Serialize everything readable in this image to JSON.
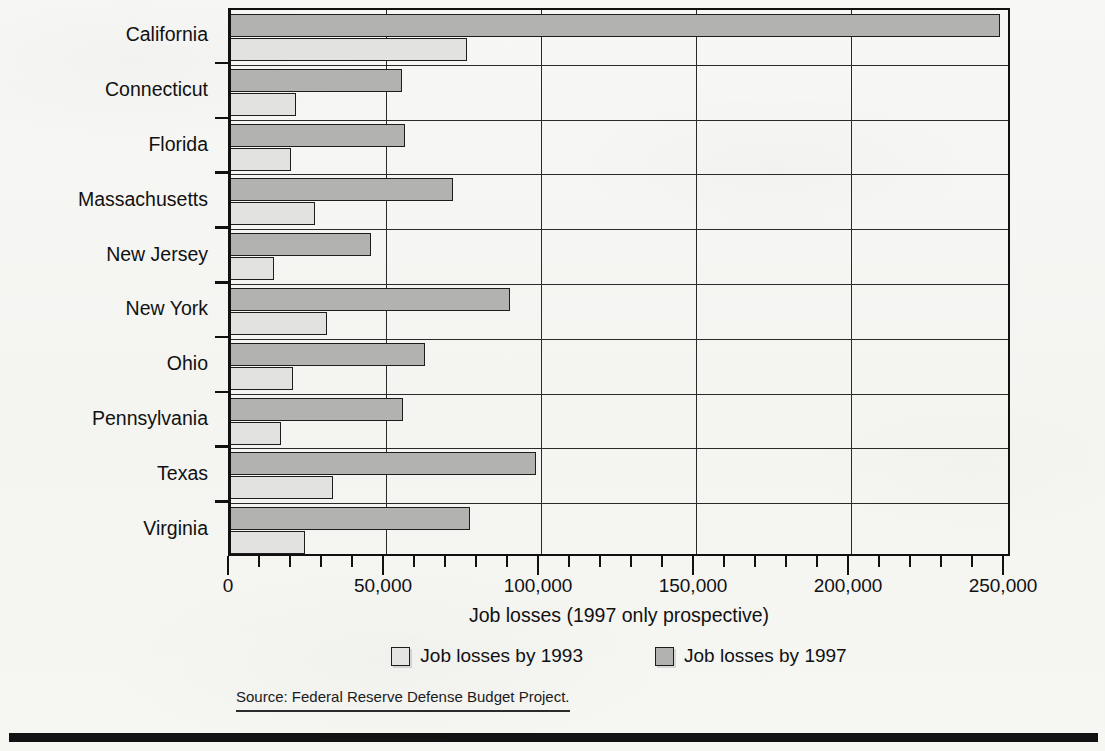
{
  "chart_data": {
    "type": "bar",
    "orientation": "horizontal",
    "title": "",
    "xlabel": "Job losses (1997 only prospective)",
    "ylabel": "",
    "xlim": [
      0,
      250000
    ],
    "xticks": [
      0,
      50000,
      100000,
      150000,
      200000,
      250000
    ],
    "xticklabels": [
      "0",
      "50,000",
      "100,000",
      "150,000",
      "200,000",
      "250,000"
    ],
    "minor_tick_step": 10000,
    "grid": "vertical major gridlines only",
    "legend_position": "below axis, centered",
    "categories": [
      "California",
      "Connecticut",
      "Florida",
      "Massachusetts",
      "New Jersey",
      "New York",
      "Ohio",
      "Pennsylvania",
      "Texas",
      "Virginia"
    ],
    "series": [
      {
        "name": "Job losses by 1993",
        "color": "#e2e2e0",
        "values": [
          76000,
          21000,
          19500,
          27000,
          14000,
          31000,
          20000,
          16000,
          33000,
          24000
        ]
      },
      {
        "name": "Job losses by 1997",
        "color": "#b2b2b0",
        "values": [
          248000,
          55000,
          56000,
          71500,
          45000,
          90000,
          62500,
          55500,
          98500,
          77000
        ]
      }
    ]
  },
  "axis": {
    "x_title": "Job losses (1997 only prospective)"
  },
  "legend": {
    "entries": [
      {
        "label": "Job losses by 1993",
        "swatch": "light-gray-swatch"
      },
      {
        "label": "Job losses by 1997",
        "swatch": "medium-gray-swatch"
      }
    ]
  },
  "source": {
    "text": "Source: Federal Reserve Defense Budget Project."
  },
  "colors": {
    "series_1993": "#e2e2e0",
    "series_1997": "#b2b2b0",
    "outline": "#1d1d1d",
    "axis": "#111111",
    "background": "#f6f6f4"
  }
}
